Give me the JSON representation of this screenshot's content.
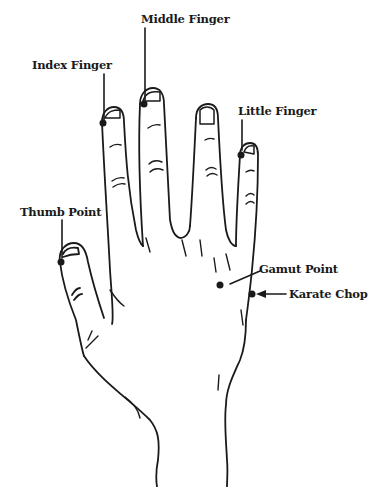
{
  "diagram": {
    "labels": {
      "middle_finger": "Middle Finger",
      "index_finger": "Index Finger",
      "little_finger": "Little Finger",
      "thumb_point": "Thumb Point",
      "gamut_point": "Gamut Point",
      "karate_chop": "Karate Chop"
    },
    "colors": {
      "ink": "#1a1a1a",
      "background": "#ffffff"
    }
  }
}
